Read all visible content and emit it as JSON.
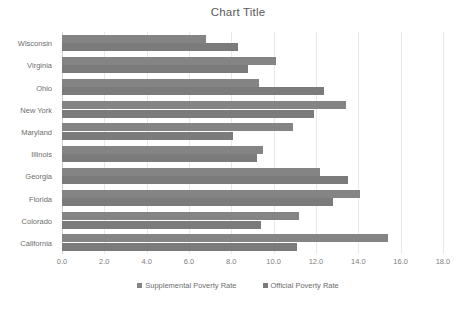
{
  "chart_data": {
    "type": "bar",
    "orientation": "horizontal",
    "title": "Chart Title",
    "xlabel": "",
    "ylabel": "",
    "xlim": [
      0.0,
      18.0
    ],
    "xtick_step": 2.0,
    "xticks": [
      "0.0",
      "2.0",
      "4.0",
      "6.0",
      "8.0",
      "10.0",
      "12.0",
      "14.0",
      "16.0",
      "18.0"
    ],
    "grid": true,
    "legend_position": "bottom",
    "categories": [
      "Wisconsin",
      "Virginia",
      "Ohio",
      "New York",
      "Maryland",
      "Illinois",
      "Georgia",
      "Florida",
      "Colorado",
      "California"
    ],
    "series": [
      {
        "name": "Supplemental Poverty Rate",
        "color": "#848484",
        "values": [
          6.8,
          10.1,
          9.3,
          13.4,
          10.9,
          9.5,
          12.2,
          14.1,
          11.2,
          15.4
        ]
      },
      {
        "name": "Official Poverty Rate",
        "color": "#7b7b7b",
        "values": [
          8.3,
          8.8,
          12.4,
          11.9,
          8.1,
          9.2,
          13.5,
          12.8,
          9.4,
          11.1
        ]
      }
    ]
  }
}
